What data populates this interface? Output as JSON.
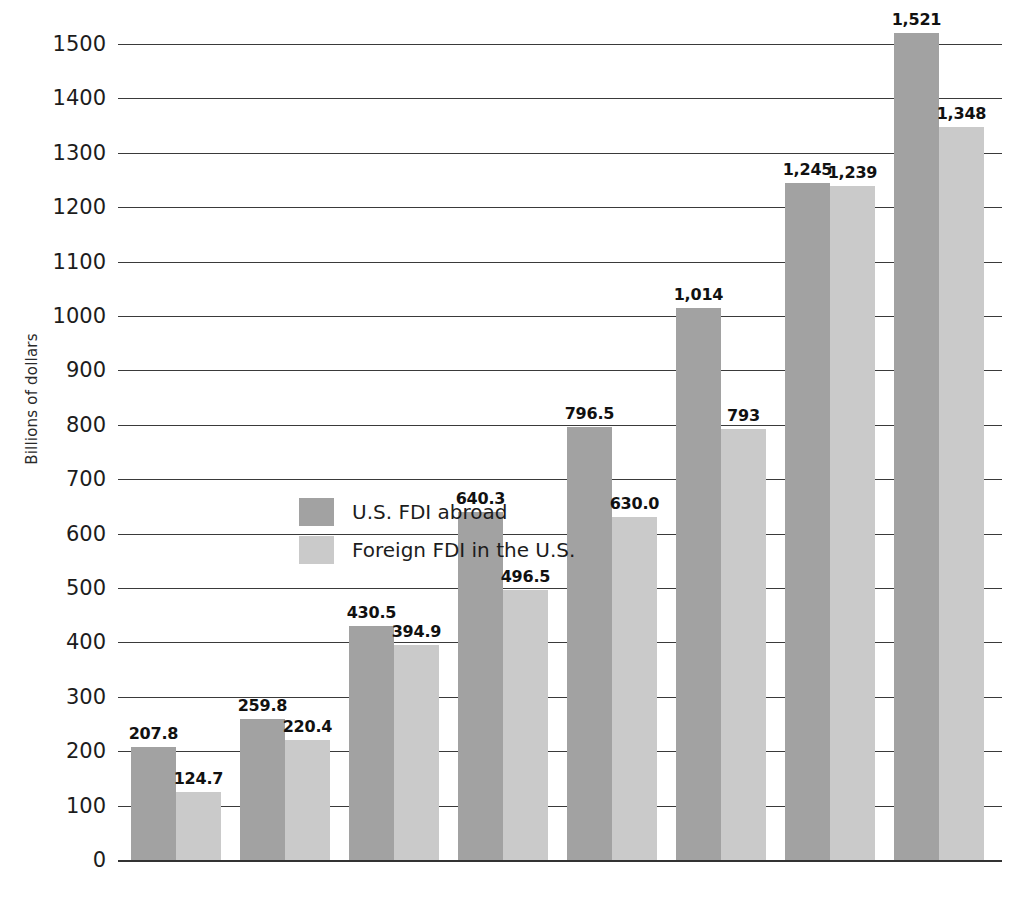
{
  "chart_data": {
    "type": "bar",
    "title": "",
    "xlabel": "",
    "ylabel": "Billions of dollars",
    "ylim": [
      0,
      1500
    ],
    "ytick_step": 100,
    "grid": true,
    "legend_position": "inside-left",
    "categories": [
      "1982",
      "1986",
      "1990",
      "1994",
      "1996",
      "1998",
      "2000",
      "2002"
    ],
    "ytick_labels": [
      "0",
      "100",
      "200",
      "300",
      "400",
      "500",
      "600",
      "700",
      "800",
      "900",
      "1000",
      "1100",
      "1200",
      "1300",
      "1400",
      "1500"
    ],
    "series": [
      {
        "name": "U.S. FDI abroad",
        "color": "#a2a2a2",
        "values": [
          207.8,
          259.8,
          430.5,
          640.3,
          796.5,
          1014,
          1245,
          1521
        ],
        "labels": [
          "207.8",
          "259.8",
          "430.5",
          "640.3",
          "796.5",
          "1,014",
          "1,245",
          "1,521"
        ]
      },
      {
        "name": "Foreign FDI in the U.S.",
        "color": "#cacaca",
        "values": [
          124.7,
          220.4,
          394.9,
          496.5,
          630.0,
          793,
          1239,
          1348
        ],
        "labels": [
          "124.7",
          "220.4",
          "394.9",
          "496.5",
          "630.0",
          "793",
          "1,239",
          "1,348"
        ]
      }
    ]
  },
  "axis": {
    "y_title": "Billions of dollars"
  },
  "legend": {
    "items": [
      {
        "label": "U.S. FDI abroad",
        "swatch": "dark"
      },
      {
        "label": "Foreign FDI in the U.S.",
        "swatch": "light"
      }
    ]
  }
}
